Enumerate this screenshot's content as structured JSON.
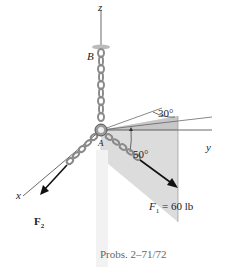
{
  "figure": {
    "caption": "Probs. 2–71/72",
    "axes": {
      "z": "z",
      "y": "y",
      "x": "x"
    },
    "points": {
      "A": "A",
      "B": "B"
    },
    "angles": {
      "elevation": "30°",
      "azimuth": "50°"
    },
    "forces": {
      "F1": {
        "symbol": "F",
        "subscript": "1",
        "value": "= 60 lb"
      },
      "F2": {
        "symbol": "F",
        "subscript": "2"
      }
    },
    "colors": {
      "shade": "#d9d9d9",
      "shade_dark": "#c8c8c8",
      "chain": "#8a8a8a",
      "line": "#333333",
      "arrow": "#111111",
      "ring": "#9a9a9a"
    }
  }
}
